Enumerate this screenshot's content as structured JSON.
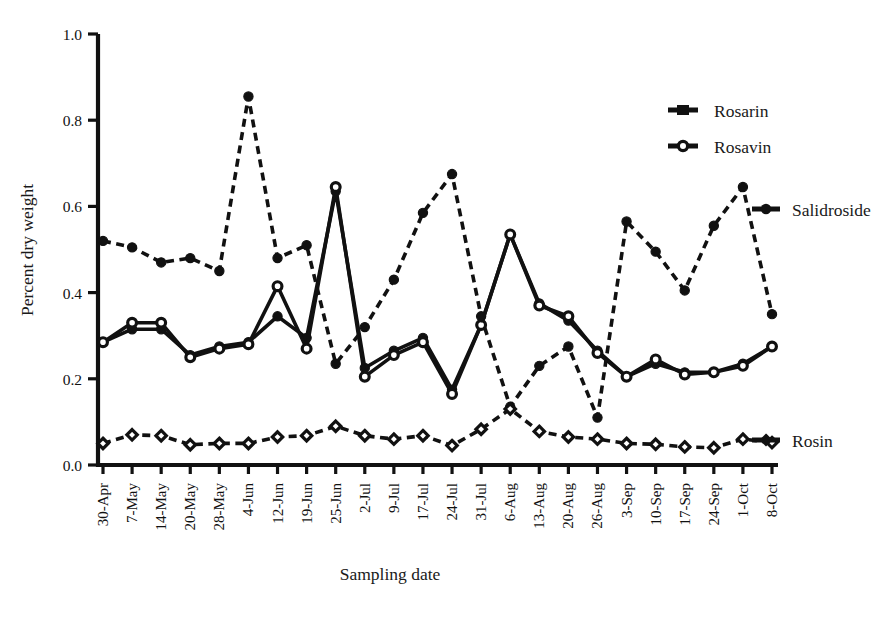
{
  "figure": {
    "background": "#ffffff",
    "ink_color": "#111111"
  },
  "chart_data": {
    "type": "line",
    "title": "",
    "xlabel": "Sampling date",
    "ylabel": "Percent dry weight",
    "ylim": [
      0.0,
      1.0
    ],
    "yticks": [
      "0.0",
      "0.2",
      "0.4",
      "0.6",
      "0.8",
      "1.0"
    ],
    "ytick_values": [
      0.0,
      0.2,
      0.4,
      0.6,
      0.8,
      1.0
    ],
    "grid": false,
    "legend_position": "upper-right",
    "categories": [
      "30-Apr",
      "7-May",
      "14-May",
      "20-May",
      "28-May",
      "4-Jun",
      "12-Jun",
      "19-Jun",
      "25-Jun",
      "2-Jul",
      "9-Jul",
      "17-Jul",
      "24-Jul",
      "31-Jul",
      "6-Aug",
      "13-Aug",
      "20-Aug",
      "26-Aug",
      "3-Sep",
      "10-Sep",
      "17-Sep",
      "24-Sep",
      "1-Oct",
      "8-Oct"
    ],
    "series": [
      {
        "name": "Rosarin",
        "style": "solid",
        "marker": "filled-circle",
        "values": [
          0.285,
          0.315,
          0.315,
          0.255,
          0.275,
          0.285,
          0.345,
          0.295,
          0.635,
          0.225,
          0.265,
          0.295,
          0.175,
          0.325,
          0.535,
          0.375,
          0.335,
          0.265,
          0.205,
          0.235,
          0.215,
          0.215,
          0.235,
          0.275
        ]
      },
      {
        "name": "Rosavin",
        "style": "solid",
        "marker": "open-circle",
        "values": [
          0.285,
          0.33,
          0.33,
          0.25,
          0.27,
          0.28,
          0.415,
          0.27,
          0.645,
          0.205,
          0.255,
          0.285,
          0.165,
          0.325,
          0.535,
          0.37,
          0.345,
          0.26,
          0.205,
          0.245,
          0.21,
          0.215,
          0.23,
          0.275
        ]
      },
      {
        "name": "Salidroside",
        "style": "dashed",
        "marker": "filled-circle",
        "values": [
          0.52,
          0.505,
          0.47,
          0.48,
          0.45,
          0.855,
          0.48,
          0.51,
          0.235,
          0.32,
          0.43,
          0.585,
          0.675,
          0.345,
          0.135,
          0.23,
          0.275,
          0.11,
          0.565,
          0.495,
          0.405,
          0.555,
          0.645,
          0.35
        ]
      },
      {
        "name": "Rosin",
        "style": "dashed",
        "marker": "open-diamond",
        "values": [
          0.05,
          0.07,
          0.068,
          0.047,
          0.05,
          0.05,
          0.065,
          0.068,
          0.09,
          0.068,
          0.06,
          0.068,
          0.045,
          0.083,
          0.13,
          0.078,
          0.065,
          0.06,
          0.05,
          0.048,
          0.042,
          0.04,
          0.06,
          0.052
        ]
      }
    ]
  },
  "legend": {
    "items": [
      {
        "label": "Rosarin",
        "marker": "filled-square-line"
      },
      {
        "label": "Rosavin",
        "marker": "open-circle-line"
      }
    ]
  },
  "inline_labels": [
    {
      "label": "Salidroside",
      "marker": "filled-circle-line"
    },
    {
      "label": "Rosin",
      "marker": "open-diamond-line"
    }
  ],
  "caption": {
    "fragment": ""
  }
}
